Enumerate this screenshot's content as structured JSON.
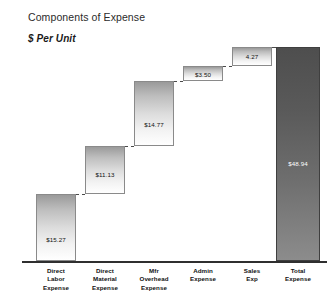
{
  "chart_data": {
    "type": "bar",
    "subtype": "waterfall",
    "title": "Components of Expense",
    "subtitle": "$ Per Unit",
    "xlabel": "",
    "ylabel": "",
    "grid": false,
    "legend": false,
    "ylim": [
      0,
      48.94
    ],
    "categories": [
      "Direct Labor Expense",
      "Direct Material Expense",
      "Mfr Overhead Expense",
      "Admin Expense",
      "Sales Exp",
      "Total Expense"
    ],
    "category_lines": [
      [
        "Direct",
        "Labor",
        "Expense"
      ],
      [
        "Direct",
        "Material",
        "Expense"
      ],
      [
        "Mfr",
        "Overhead",
        "Expense"
      ],
      [
        "Admin",
        "Expense"
      ],
      [
        "Sales",
        "Exp"
      ],
      [
        "Total",
        "Expense"
      ]
    ],
    "values": [
      15.27,
      11.13,
      14.77,
      3.5,
      4.27,
      48.94
    ],
    "data_labels": [
      "$15.27",
      "$11.13",
      "$14.77",
      "$3.50",
      "4.27",
      "$48.94"
    ],
    "cumulative_base": [
      0,
      15.27,
      26.4,
      41.17,
      44.67,
      0
    ],
    "cumulative_top": [
      15.27,
      26.4,
      41.17,
      44.67,
      48.94,
      48.94
    ],
    "is_total": [
      false,
      false,
      false,
      false,
      false,
      true
    ],
    "colors": {
      "step_bar_top": "#9a9a9a",
      "step_bar_bottom": "#ffffff",
      "total_bar_top": "#4e4e4e",
      "total_bar_bottom": "#8c8c8c",
      "bar_outline": "#8a8a8a",
      "baseline": "#2f2f2f",
      "connector": "#4a4a4a",
      "text": "#111111",
      "total_label_text": "#ffffff"
    }
  }
}
